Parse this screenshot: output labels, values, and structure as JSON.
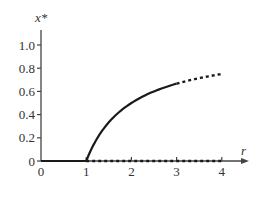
{
  "chart_data": {
    "type": "line",
    "title": "",
    "xlabel": "r",
    "ylabel": "x*",
    "xlim": [
      0,
      4.5
    ],
    "ylim": [
      0,
      1.15
    ],
    "grid": false,
    "legend": null,
    "x_ticks": [
      0,
      1,
      2,
      3,
      4
    ],
    "x_tick_labels": [
      "0",
      "1",
      "2",
      "3",
      "4"
    ],
    "y_ticks": [
      0,
      0.2,
      0.4,
      0.6,
      0.8,
      1.0
    ],
    "y_tick_labels": [
      "0",
      "0.2",
      "0.4",
      "0.6",
      "0.8",
      "1.0"
    ],
    "series": [
      {
        "name": "x* = 0 (stable)",
        "style": "solid",
        "x": [
          0,
          1
        ],
        "y": [
          0,
          0
        ]
      },
      {
        "name": "x* = 0 (unstable)",
        "style": "dotted",
        "x": [
          1,
          4
        ],
        "y": [
          0,
          0
        ]
      },
      {
        "name": "x* = 1 - 1/r (stable)",
        "style": "solid",
        "x": [
          1,
          1.25,
          1.5,
          1.75,
          2,
          2.25,
          2.5,
          2.75,
          3
        ],
        "y": [
          0,
          0.2,
          0.333,
          0.429,
          0.5,
          0.556,
          0.6,
          0.636,
          0.667
        ]
      },
      {
        "name": "x* = 1 - 1/r (unstable)",
        "style": "dotted",
        "x": [
          3,
          3.25,
          3.5,
          3.75,
          4
        ],
        "y": [
          0.667,
          0.692,
          0.714,
          0.733,
          0.75
        ]
      }
    ]
  },
  "labels": {
    "x_axis": "r",
    "y_axis": "x*"
  },
  "colors": {
    "curve": "#1a1a1a",
    "axis": "#444444"
  }
}
